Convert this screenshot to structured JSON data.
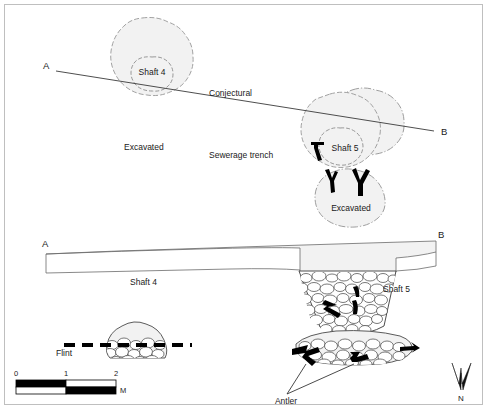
{
  "figure": {
    "type": "archaeological-plan-and-section",
    "border_color": "#bfbfbf",
    "background": "#ffffff",
    "feature_fill": "#f2f2f2",
    "feature_outline": "#8c8c8c",
    "line_color": "#1a1a1a"
  },
  "plan": {
    "section_line_label_left": "A",
    "section_line_label_right": "B",
    "shaft4_label": "Shaft 4",
    "shaft5_label": "Shaft 5",
    "conjectural_label": "Conjectural",
    "excavated_label_left": "Excavated",
    "excavated_label_lower": "Excavated",
    "sewerage_trench_label": "Sewerage trench"
  },
  "section": {
    "label_left": "A",
    "label_right": "B",
    "shaft4_label": "Shaft 4",
    "shaft5_label": "Shaft 5",
    "flint_label": "Flint",
    "antler_label": "Antler"
  },
  "scale_bar": {
    "ticks": [
      "0",
      "1",
      "2"
    ],
    "unit": "M",
    "segments": 2,
    "max_metres": 2
  },
  "north_arrow": {
    "label": "N",
    "icon": "north-arrow-icon"
  }
}
